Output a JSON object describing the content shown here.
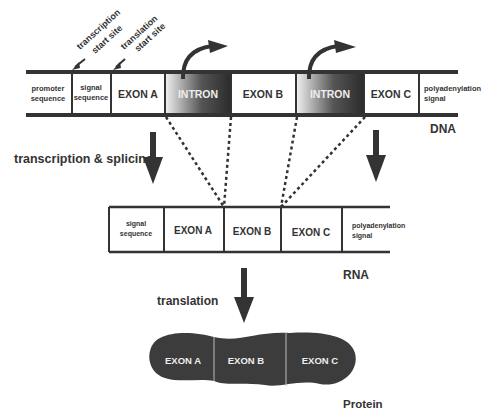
{
  "dna": {
    "label": "DNA",
    "segments": [
      {
        "label1": "promoter",
        "label2": "sequence",
        "type": "region"
      },
      {
        "label1": "signal",
        "label2": "sequence",
        "type": "region"
      },
      {
        "label": "EXON A",
        "type": "exon"
      },
      {
        "label": "INTRON",
        "type": "intron"
      },
      {
        "label": "EXON B",
        "type": "exon"
      },
      {
        "label": "INTRON",
        "type": "intron"
      },
      {
        "label": "EXON C",
        "type": "exon"
      },
      {
        "label1": "polyadenylation",
        "label2": "signal",
        "type": "region"
      }
    ],
    "annotations": {
      "transcription_start_1": "transcription",
      "transcription_start_2": "start site",
      "translation_start_1": "translation",
      "translation_start_2": "start site"
    }
  },
  "process1": "transcription & splicing",
  "rna": {
    "label": "RNA",
    "segments": [
      {
        "label1": "signal",
        "label2": "sequence"
      },
      {
        "label": "EXON A"
      },
      {
        "label": "EXON B"
      },
      {
        "label": "EXON C"
      },
      {
        "label1": "polyadenylation",
        "label2": "signal"
      }
    ]
  },
  "process2": "translation",
  "protein": {
    "label": "Protein",
    "segments": [
      {
        "label": "EXON A"
      },
      {
        "label": "EXON B"
      },
      {
        "label": "EXON C"
      }
    ]
  }
}
